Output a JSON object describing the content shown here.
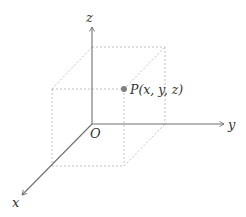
{
  "diagram": {
    "type": "3d-coordinate-system",
    "axes": {
      "x_label": "x",
      "y_label": "y",
      "z_label": "z"
    },
    "origin_label": "O",
    "point": {
      "label": "P(x, y, z)",
      "color": "#808080"
    },
    "colors": {
      "axis": "#707070",
      "guide_dashed": "#bbbbbb",
      "text": "#333333"
    }
  }
}
